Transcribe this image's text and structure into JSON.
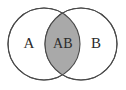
{
  "figure": {
    "background_color": "#ffffff",
    "width": 126,
    "height": 90
  },
  "diagram": {
    "type": "venn-2-set",
    "stroke_color": "#4a4a4a",
    "stroke_width": 1.1,
    "circle_fill": "#ffffff",
    "intersection_fill": "#a9a9a9",
    "text_color": "#2b2b2b",
    "sets": [
      {
        "id": "set-a",
        "label": "A",
        "cx": 44,
        "cy": 44,
        "r": 36,
        "label_x": 29,
        "label_y": 45,
        "fill": "#ffffff"
      },
      {
        "id": "set-b",
        "label": "B",
        "cx": 81,
        "cy": 44,
        "r": 36,
        "label_x": 96,
        "label_y": 45,
        "fill": "#ffffff"
      }
    ],
    "intersection": {
      "id": "set-ab",
      "label": "AB",
      "label_x": 63,
      "label_y": 45,
      "fill": "#a9a9a9",
      "left_x": 48,
      "right_x": 80,
      "top_y": 9,
      "bottom_y": 79
    }
  }
}
